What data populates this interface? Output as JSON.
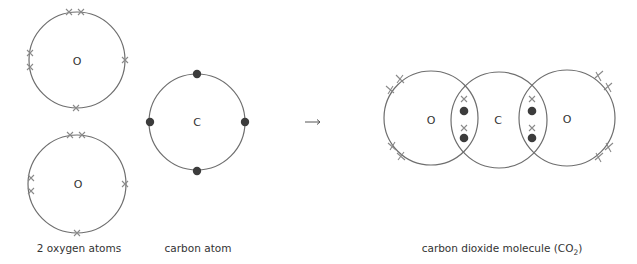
{
  "left_group": {
    "oxygen_atoms": [
      {
        "symbol": "O",
        "electron_marker": "cross",
        "outer_electrons": 6
      },
      {
        "symbol": "O",
        "electron_marker": "cross",
        "outer_electrons": 6
      }
    ],
    "caption": "2 oxygen atoms"
  },
  "carbon": {
    "symbol": "C",
    "electron_marker": "dot",
    "outer_electrons": 4,
    "caption": "carbon atom"
  },
  "arrow": {
    "icon": "right-arrow-icon",
    "glyph": "→"
  },
  "molecule": {
    "atoms": [
      {
        "symbol": "O",
        "lone_crosses": 4
      },
      {
        "symbol": "C"
      },
      {
        "symbol": "O",
        "lone_crosses": 4
      }
    ],
    "shared_pairs": [
      {
        "between": "O-C",
        "crosses": 2,
        "dots": 2
      },
      {
        "between": "C-O",
        "crosses": 2,
        "dots": 2
      }
    ],
    "caption_main": "carbon dioxide molecule (CO",
    "caption_sub": "2",
    "caption_end": ")"
  }
}
